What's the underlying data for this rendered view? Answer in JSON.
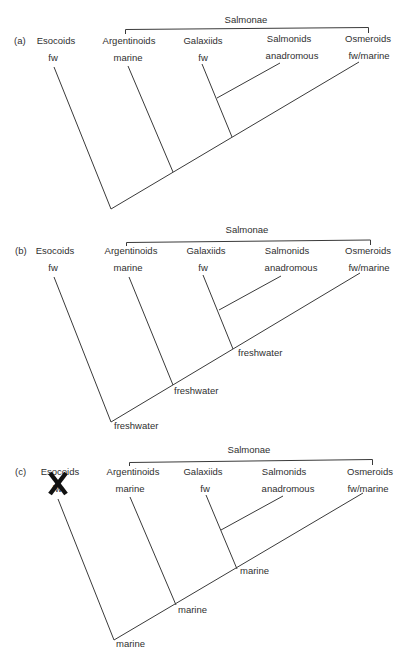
{
  "clade_label": "Salmonae",
  "taxa": [
    {
      "name": "Esocoids",
      "habitat": "fw"
    },
    {
      "name": "Argentinoids",
      "habitat": "marine"
    },
    {
      "name": "Galaxiids",
      "habitat": "fw"
    },
    {
      "name": "Salmonids",
      "habitat": "anadromous"
    },
    {
      "name": "Osmeroids",
      "habitat": "fw/marine"
    }
  ],
  "panels": [
    {
      "id": "(a)",
      "ancestral_states": [
        "",
        "",
        ""
      ],
      "excluded_taxon": ""
    },
    {
      "id": "(b)",
      "ancestral_states": [
        "freshwater",
        "freshwater",
        "freshwater"
      ],
      "excluded_taxon": ""
    },
    {
      "id": "(c)",
      "ancestral_states": [
        "marine",
        "marine",
        "marine"
      ],
      "excluded_taxon": "Esocoids",
      "exclusion_mark": "X"
    }
  ],
  "colors": {
    "line": "#3a3a3a",
    "text": "#2f2f2f",
    "cross": "#111111"
  }
}
